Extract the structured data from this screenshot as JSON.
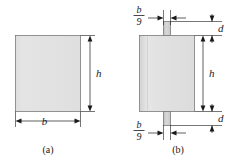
{
  "figure": {
    "background_color": "#ffffff",
    "line_color": "#1a1a1a",
    "shape_fill": "#dcdcdc",
    "shape_stroke": "#7a7a7a",
    "tab_fill": "#cccccc"
  },
  "panel_a": {
    "caption": "(a)",
    "width_label": "b",
    "height_label": "h",
    "shape": "plain-rectangle"
  },
  "panel_b": {
    "caption": "(b)",
    "height_label": "h",
    "tab_width_numerator": "b",
    "tab_width_denominator": "9",
    "top_gap_label": "d",
    "bottom_gap_label": "d",
    "shape": "rectangle-with-tabs"
  }
}
